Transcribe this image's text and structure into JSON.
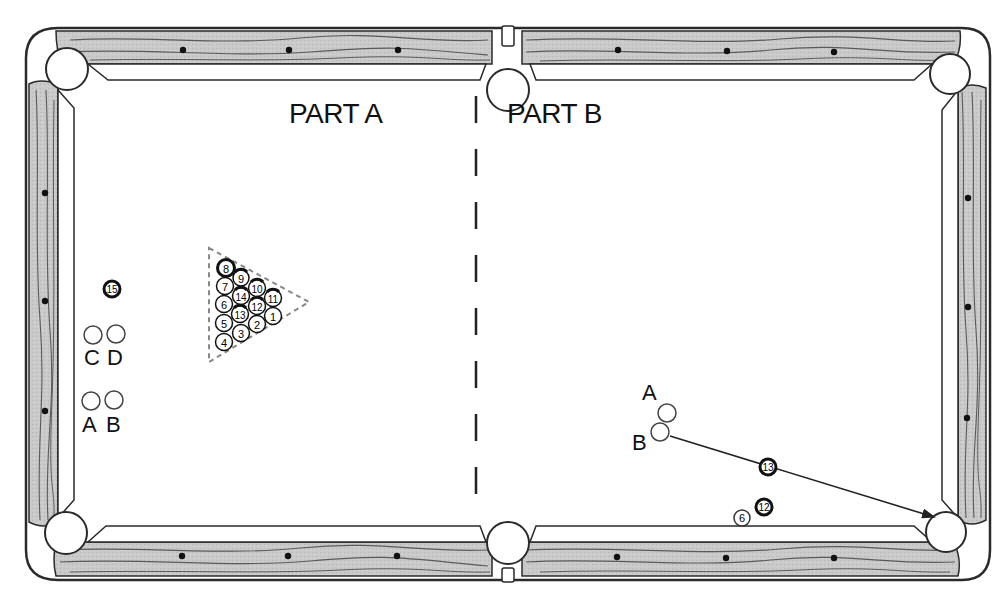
{
  "diagram": {
    "type": "billiards-table-diagram",
    "colors": {
      "background": "#ffffff",
      "rail_wood": "#c8c8c8",
      "wood_grain": "#5a5a5a",
      "outline": "#2a2a2a",
      "diamond": "#111111",
      "solid_ball_fill": "#1a1a1a",
      "rack_dash": "#888888"
    },
    "sections": {
      "part_a": {
        "label": "PART A"
      },
      "part_b": {
        "label": "PART B"
      }
    },
    "part_a": {
      "rack": {
        "shape": "triangle",
        "balls": [
          {
            "number": "8",
            "style": "solid-ring"
          },
          {
            "number": "9",
            "style": "stripe"
          },
          {
            "number": "10",
            "style": "stripe"
          },
          {
            "number": "11",
            "style": "stripe"
          },
          {
            "number": "7",
            "style": "plain"
          },
          {
            "number": "14",
            "style": "stripe"
          },
          {
            "number": "12",
            "style": "stripe"
          },
          {
            "number": "1",
            "style": "plain"
          },
          {
            "number": "6",
            "style": "plain"
          },
          {
            "number": "13",
            "style": "stripe"
          },
          {
            "number": "2",
            "style": "plain"
          },
          {
            "number": "5",
            "style": "plain"
          },
          {
            "number": "3",
            "style": "plain"
          },
          {
            "number": "4",
            "style": "plain"
          }
        ]
      },
      "loose_ball": {
        "number": "15",
        "style": "stripe"
      },
      "cue_positions": [
        {
          "label": "C"
        },
        {
          "label": "D"
        },
        {
          "label": "A"
        },
        {
          "label": "B"
        }
      ]
    },
    "part_b": {
      "cue_positions": [
        {
          "label": "A"
        },
        {
          "label": "B"
        }
      ],
      "object_balls": [
        {
          "number": "13",
          "style": "stripe"
        },
        {
          "number": "12",
          "style": "stripe"
        },
        {
          "number": "6",
          "style": "plain"
        }
      ],
      "shot_path": {
        "from": "B",
        "to": "bottom-right-pocket",
        "arrow": true
      }
    },
    "pockets": [
      "top-left",
      "top-center",
      "top-right",
      "bottom-left",
      "bottom-center",
      "bottom-right"
    ],
    "diamonds_per_long_rail_segment": 3,
    "diamonds_per_short_rail": 3
  }
}
